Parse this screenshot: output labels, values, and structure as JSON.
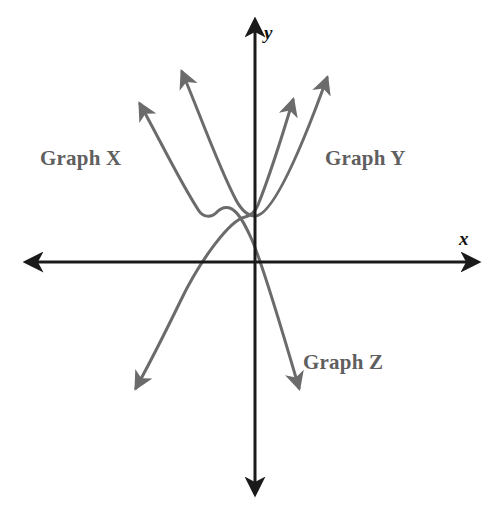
{
  "figure": {
    "width": 502,
    "height": 520,
    "background_color": "#ffffff",
    "origin": {
      "x": 255,
      "y": 262
    }
  },
  "axes": {
    "color": "#1a1a1a",
    "stroke_width": 3,
    "x_axis": {
      "label": "x",
      "label_position": {
        "x": 459,
        "y": 228
      },
      "from": {
        "x": 20,
        "y": 262
      },
      "to": {
        "x": 484,
        "y": 262
      },
      "arrows": "both"
    },
    "y_axis": {
      "label": "y",
      "label_position": {
        "x": 264,
        "y": 22
      },
      "from": {
        "x": 255,
        "y": 14
      },
      "to": {
        "x": 255,
        "y": 500
      },
      "arrows": "both"
    }
  },
  "curves": {
    "color": "#6b6b6b",
    "stroke_width": 3,
    "items": [
      {
        "name": "graph-x",
        "label": "Graph X",
        "label_position": {
          "x": 40,
          "y": 146
        },
        "shape": "downward-opening parabola",
        "vertex": {
          "x": 207,
          "y": 218
        },
        "arrow_tips": [
          {
            "x": 133,
            "y": 96
          },
          {
            "x": 303,
            "y": 398
          }
        ],
        "description": "Concave-down curve entering from upper left, peaking left of the y-axis above the x-axis, and descending through the origin into the fourth quadrant"
      },
      {
        "name": "graph-y",
        "label": "Graph Y",
        "label_position": {
          "x": 325,
          "y": 146
        },
        "shape": "upward-opening parabola",
        "vertex": {
          "x": 252,
          "y": 214
        },
        "arrow_tips": [
          {
            "x": 177,
            "y": 62
          },
          {
            "x": 333,
            "y": 68
          }
        ],
        "description": "Concave-up parabola with vertex just left of the y-axis above the x-axis, both branches rising steeply"
      },
      {
        "name": "graph-z",
        "label": "Graph Z",
        "label_position": {
          "x": 303,
          "y": 350
        },
        "shape": "upward-opening steep curve",
        "vertex": {
          "x": 253,
          "y": 213
        },
        "arrow_tips": [
          {
            "x": 132,
            "y": 396
          },
          {
            "x": 295,
            "y": 90
          }
        ],
        "description": "Steep curve descending from upper right through the vertex region near the y-axis and continuing down to the lower left through the third quadrant"
      }
    ]
  },
  "labels": {
    "graph_x": "Graph X",
    "graph_y": "Graph Y",
    "graph_z": "Graph Z",
    "axis_x": "x",
    "axis_y": "y"
  },
  "colors": {
    "axis": "#1a1a1a",
    "curve": "#6b6b6b",
    "curve_label": "#5f5f5f",
    "axis_label": "#111111",
    "background": "#ffffff"
  }
}
